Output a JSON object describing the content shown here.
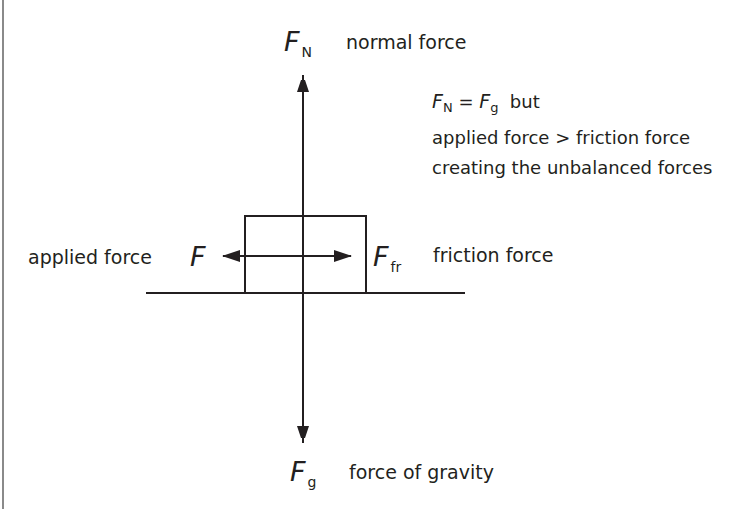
{
  "diagram": {
    "type": "free-body-diagram",
    "colors": {
      "ink": "#231f20",
      "border": "#8a8a8a",
      "background": "#ffffff"
    },
    "forces": {
      "normal": {
        "symbol": "F",
        "subscript": "N",
        "label": "normal force",
        "direction": "up"
      },
      "gravity": {
        "symbol": "F",
        "subscript": "g",
        "label": "force of gravity",
        "direction": "down"
      },
      "applied": {
        "symbol": "F",
        "subscript": "",
        "label": "applied force",
        "direction": "left"
      },
      "friction": {
        "symbol": "F",
        "subscript": "fr",
        "label": "friction force",
        "direction": "right"
      }
    },
    "note": {
      "line1": {
        "lhs_symbol": "F",
        "lhs_sub": "N",
        "equals": " = ",
        "rhs_symbol": "F",
        "rhs_sub": "g",
        "tail": "  but"
      },
      "line2": "applied force > friction force",
      "line3": "creating the unbalanced forces"
    }
  }
}
